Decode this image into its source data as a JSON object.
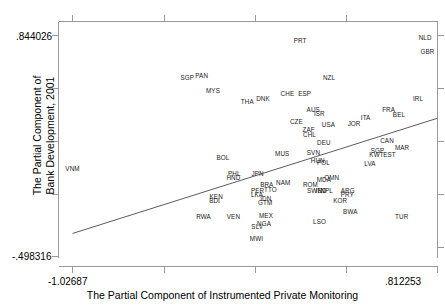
{
  "chart_data": {
    "type": "scatter",
    "title": "",
    "xlabel": "The Partial Component of Instrumented Private Monitoring",
    "ylabel": "The Partial Component of\nBank Development, 2001",
    "ylabel_line1": "The Partial Component of",
    "ylabel_line2": "Bank Development, 2001",
    "xlim": [
      -1.02687,
      0.812253
    ],
    "ylim": [
      -0.498316,
      0.844026
    ],
    "x_tick_labels": [
      "-1.02687",
      ".812253"
    ],
    "y_tick_labels": [
      "-.498316",
      ".844026"
    ],
    "grid": false,
    "legend": false,
    "marker_style": "text-label",
    "fit_line": {
      "type": "linear",
      "x_start": -1.02687,
      "y_start": -0.3585,
      "x_end": 0.812253,
      "y_end": 0.3415
    },
    "points": [
      {
        "label": "VNM",
        "x": -1.02687,
        "y": 0.0345
      },
      {
        "label": "SGP",
        "x": -0.448,
        "y": 0.585
      },
      {
        "label": "PAN",
        "x": -0.376,
        "y": 0.598
      },
      {
        "label": "MYS",
        "x": -0.319,
        "y": 0.509
      },
      {
        "label": "THA",
        "x": -0.146,
        "y": 0.439
      },
      {
        "label": "PRT",
        "x": 0.12,
        "y": 0.81
      },
      {
        "label": "NLD",
        "x": 0.75,
        "y": 0.827
      },
      {
        "label": "GBR",
        "x": 0.762,
        "y": 0.743
      },
      {
        "label": "NZL",
        "x": 0.266,
        "y": 0.583
      },
      {
        "label": "DNK",
        "x": -0.067,
        "y": 0.456
      },
      {
        "label": "CHE",
        "x": 0.056,
        "y": 0.488
      },
      {
        "label": "ESP",
        "x": 0.143,
        "y": 0.488
      },
      {
        "label": "IRL",
        "x": 0.714,
        "y": 0.459
      },
      {
        "label": "AUS",
        "x": 0.186,
        "y": 0.394
      },
      {
        "label": "ISR",
        "x": 0.217,
        "y": 0.368
      },
      {
        "label": "FRA",
        "x": 0.566,
        "y": 0.39
      },
      {
        "label": "BEL",
        "x": 0.618,
        "y": 0.362
      },
      {
        "label": "CZE",
        "x": 0.101,
        "y": 0.321
      },
      {
        "label": "USA",
        "x": 0.263,
        "y": 0.303
      },
      {
        "label": "JOR",
        "x": 0.392,
        "y": 0.306
      },
      {
        "label": "ITA",
        "x": 0.45,
        "y": 0.34
      },
      {
        "label": "ZAF",
        "x": 0.163,
        "y": 0.268
      },
      {
        "label": "CHL",
        "x": 0.167,
        "y": 0.241
      },
      {
        "label": "DEU",
        "x": 0.24,
        "y": 0.189
      },
      {
        "label": "CAN",
        "x": 0.558,
        "y": 0.203
      },
      {
        "label": "MAR",
        "x": 0.634,
        "y": 0.16
      },
      {
        "label": "SGP2",
        "x": 0.51,
        "y": 0.14
      },
      {
        "label": "KWT",
        "x": 0.505,
        "y": 0.119
      },
      {
        "label": "EST",
        "x": 0.57,
        "y": 0.117
      },
      {
        "label": "LVA",
        "x": 0.472,
        "y": 0.066
      },
      {
        "label": "MUS",
        "x": 0.03,
        "y": 0.122
      },
      {
        "label": "SVN",
        "x": 0.187,
        "y": 0.13
      },
      {
        "label": "HUN",
        "x": 0.209,
        "y": 0.084
      },
      {
        "label": "POL",
        "x": 0.238,
        "y": 0.068
      },
      {
        "label": "BOL",
        "x": -0.269,
        "y": 0.102
      },
      {
        "label": "JPN",
        "x": -0.094,
        "y": 0.005
      },
      {
        "label": "PHL",
        "x": -0.212,
        "y": 0.002
      },
      {
        "label": "HND",
        "x": -0.216,
        "y": -0.022
      },
      {
        "label": "NAM",
        "x": 0.035,
        "y": -0.051
      },
      {
        "label": "ROM",
        "x": 0.172,
        "y": -0.063
      },
      {
        "label": "OMN",
        "x": 0.279,
        "y": -0.023
      },
      {
        "label": "MDA",
        "x": 0.24,
        "y": -0.036
      },
      {
        "label": "BRA",
        "x": -0.048,
        "y": -0.063
      },
      {
        "label": "SWE",
        "x": 0.192,
        "y": -0.1
      },
      {
        "label": "IND",
        "x": 0.226,
        "y": -0.102
      },
      {
        "label": "NPL",
        "x": 0.254,
        "y": -0.098
      },
      {
        "label": "ARG",
        "x": 0.36,
        "y": -0.1
      },
      {
        "label": "PRY",
        "x": 0.358,
        "y": -0.124
      },
      {
        "label": "PER",
        "x": -0.094,
        "y": -0.1
      },
      {
        "label": "LKA",
        "x": -0.097,
        "y": -0.122
      },
      {
        "label": "TTO",
        "x": -0.03,
        "y": -0.096
      },
      {
        "label": "IDN",
        "x": -0.053,
        "y": -0.15
      },
      {
        "label": "GTM",
        "x": -0.056,
        "y": -0.172
      },
      {
        "label": "KEN",
        "x": -0.303,
        "y": -0.137
      },
      {
        "label": "BDI",
        "x": -0.311,
        "y": -0.159
      },
      {
        "label": "TUR",
        "x": 0.632,
        "y": -0.259
      },
      {
        "label": "KOR",
        "x": 0.322,
        "y": -0.164
      },
      {
        "label": "BWA",
        "x": 0.373,
        "y": -0.226
      },
      {
        "label": "LSO",
        "x": 0.218,
        "y": -0.29
      },
      {
        "label": "RWA",
        "x": -0.367,
        "y": -0.256
      },
      {
        "label": "VEN",
        "x": -0.216,
        "y": -0.256
      },
      {
        "label": "MEX",
        "x": -0.052,
        "y": -0.253
      },
      {
        "label": "SLV",
        "x": -0.096,
        "y": -0.317
      },
      {
        "label": "NGA",
        "x": -0.062,
        "y": -0.302
      },
      {
        "label": "MWI",
        "x": -0.1,
        "y": -0.391
      }
    ]
  },
  "axes": {
    "y_max_label": ".844026",
    "y_min_label": "-.498316",
    "x_min_label": "-1.02687",
    "x_max_label": ".812253",
    "x_title": "The Partial Component of Instrumented Private Monitoring",
    "y_title_line1": "The Partial Component of",
    "y_title_line2": "Bank Development, 2001"
  }
}
